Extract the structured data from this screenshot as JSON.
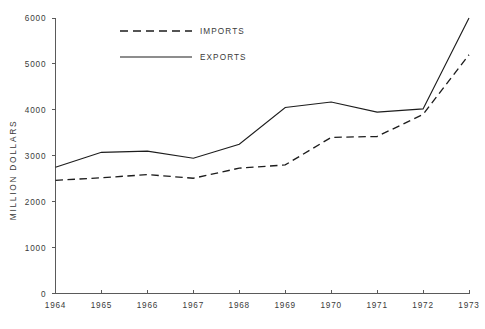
{
  "chart_data": {
    "type": "line",
    "title": "",
    "subtitle": "",
    "xlabel": "",
    "ylabel": "MILLION DOLLARS",
    "x": [
      1964,
      1965,
      1966,
      1967,
      1968,
      1969,
      1970,
      1971,
      1972,
      1973
    ],
    "xtick_labels": [
      "1964",
      "1965",
      "1966",
      "1967",
      "1968",
      "1969",
      "1970",
      "1971",
      "1972",
      "1973"
    ],
    "ytick_labels": [
      "0",
      "1000",
      "2000",
      "3000",
      "4000",
      "5000",
      "6000"
    ],
    "ytick_values": [
      0,
      1000,
      2000,
      3000,
      4000,
      5000,
      6000
    ],
    "ylim": [
      0,
      6000
    ],
    "xlim": [
      1964,
      1973
    ],
    "grid": false,
    "legend_position": "top-center",
    "series": [
      {
        "name": "IMPORTS",
        "style": "dashed",
        "color": "#1d1d1d",
        "values": [
          2465,
          2520,
          2590,
          2510,
          2730,
          2800,
          3400,
          3420,
          3900,
          5200
        ]
      },
      {
        "name": "EXPORTS",
        "style": "solid",
        "color": "#1d1d1d",
        "values": [
          2750,
          3075,
          3100,
          2945,
          3250,
          4050,
          4170,
          3950,
          4020,
          6000
        ]
      }
    ]
  },
  "legend": {
    "items": [
      {
        "label": "IMPORTS",
        "style": "dashed"
      },
      {
        "label": "EXPORTS",
        "style": "solid"
      }
    ]
  },
  "axes": {
    "y_axis_title": "MILLION DOLLARS"
  },
  "colors": {
    "line": "#1d1d1d",
    "axis": "#5a5a5a",
    "text": "#3a3a3a",
    "background": "#ffffff"
  }
}
